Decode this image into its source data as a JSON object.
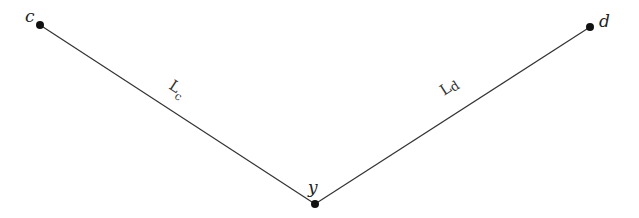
{
  "diagram": {
    "nodes": [
      {
        "id": "c",
        "label": "c",
        "x": 40,
        "y": 25
      },
      {
        "id": "d",
        "label": "d",
        "x": 590,
        "y": 27
      },
      {
        "id": "y",
        "label": "y",
        "x": 315,
        "y": 204
      }
    ],
    "edges": [
      {
        "from": "c",
        "to": "y",
        "label": "L",
        "subscript": "c"
      },
      {
        "from": "d",
        "to": "y",
        "label": "L",
        "subscript": "d"
      }
    ],
    "colors": {
      "line": "#333333",
      "node": "#111111"
    }
  }
}
